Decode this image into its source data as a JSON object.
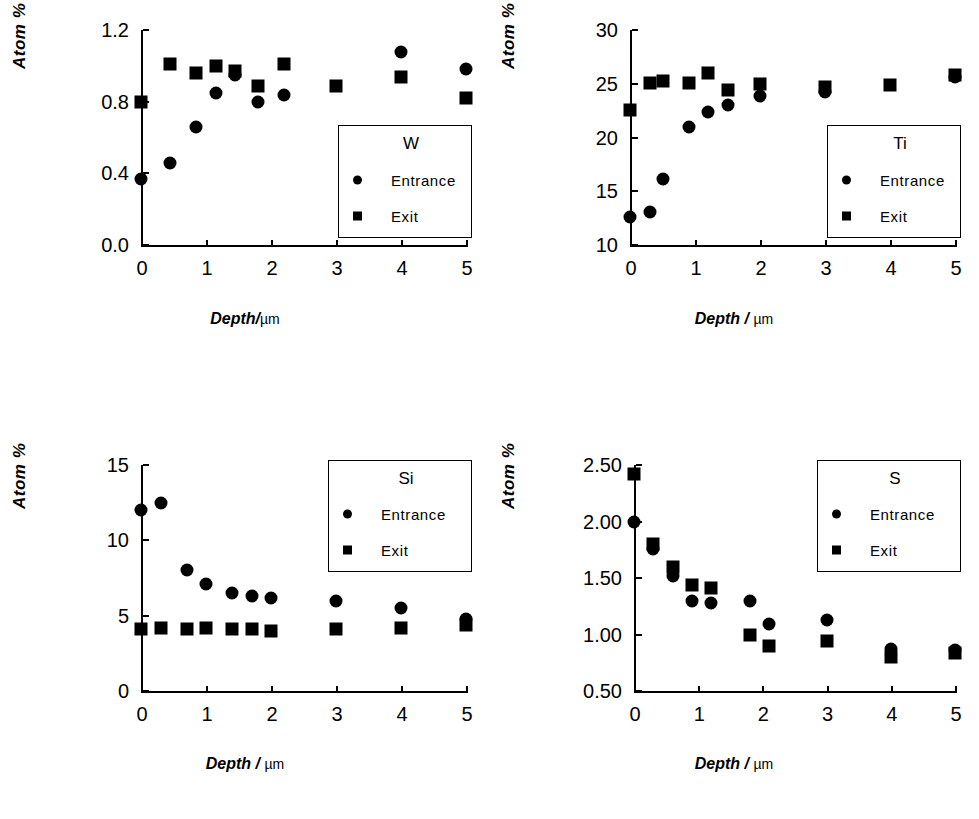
{
  "figure": {
    "marker_color": "#000000",
    "axis_color": "#000000",
    "background": "#ffffff"
  },
  "chart_data": [
    {
      "id": "w",
      "type": "scatter",
      "title": "W",
      "xlabel": "Depth/",
      "xunit": "µm",
      "ylabel": "Atom",
      "ylabel_unit": "%",
      "xlim": [
        0,
        5
      ],
      "ylim": [
        0.0,
        1.2
      ],
      "xticks": [
        0,
        1,
        2,
        3,
        4,
        5
      ],
      "xticklabels": [
        "0",
        "1",
        "2",
        "3",
        "4",
        "5"
      ],
      "yticks": [
        0.0,
        0.4,
        0.8,
        1.2
      ],
      "yticklabels": [
        "0.0",
        "0.4",
        "0.8",
        "1.2"
      ],
      "grid": false,
      "legend_position": "lower-right",
      "series": [
        {
          "name": "Entrance",
          "marker": "circle",
          "x": [
            0.0,
            0.45,
            0.85,
            1.15,
            1.45,
            1.8,
            2.2,
            4.0,
            5.0
          ],
          "y": [
            0.37,
            0.46,
            0.66,
            0.85,
            0.95,
            0.8,
            0.84,
            1.08,
            0.98
          ]
        },
        {
          "name": "Exit",
          "marker": "square",
          "x": [
            0.0,
            0.45,
            0.85,
            1.15,
            1.45,
            1.8,
            2.2,
            3.0,
            4.0,
            5.0
          ],
          "y": [
            0.8,
            1.01,
            0.96,
            1.0,
            0.97,
            0.89,
            1.01,
            0.89,
            0.94,
            0.82
          ]
        }
      ]
    },
    {
      "id": "ti",
      "type": "scatter",
      "title": "Ti",
      "xlabel": "Depth",
      "xunit": "µm",
      "xsep": " / ",
      "ylabel": "Atom",
      "ylabel_unit": "%",
      "xlim": [
        0,
        5
      ],
      "ylim": [
        10,
        30
      ],
      "xticks": [
        0,
        1,
        2,
        3,
        4,
        5
      ],
      "xticklabels": [
        "0",
        "1",
        "2",
        "3",
        "4",
        "5"
      ],
      "yticks": [
        10,
        15,
        20,
        25,
        30
      ],
      "yticklabels": [
        "10",
        "15",
        "20",
        "25",
        "30"
      ],
      "grid": false,
      "legend_position": "lower-right",
      "series": [
        {
          "name": "Entrance",
          "marker": "circle",
          "x": [
            0.0,
            0.3,
            0.5,
            0.9,
            1.2,
            1.5,
            2.0,
            3.0,
            5.0
          ],
          "y": [
            12.6,
            13.1,
            16.1,
            21.0,
            22.4,
            23.0,
            23.9,
            24.2,
            25.6
          ]
        },
        {
          "name": "Exit",
          "marker": "square",
          "x": [
            0.0,
            0.3,
            0.5,
            0.9,
            1.2,
            1.5,
            2.0,
            3.0,
            4.0,
            5.0
          ],
          "y": [
            22.6,
            25.1,
            25.3,
            25.1,
            26.0,
            24.4,
            25.0,
            24.7,
            24.9,
            25.8
          ]
        }
      ]
    },
    {
      "id": "si",
      "type": "scatter",
      "title": "Si",
      "xlabel": "Depth",
      "xunit": "µm",
      "xsep": " / ",
      "ylabel": "Atom",
      "ylabel_unit": "%",
      "xlim": [
        0,
        5
      ],
      "ylim": [
        0,
        15
      ],
      "xticks": [
        0,
        1,
        2,
        3,
        4,
        5
      ],
      "xticklabels": [
        "0",
        "1",
        "2",
        "3",
        "4",
        "5"
      ],
      "yticks": [
        0,
        5,
        10,
        15
      ],
      "yticklabels": [
        "0",
        "5",
        "10",
        "15"
      ],
      "grid": false,
      "legend_position": "upper-right",
      "series": [
        {
          "name": "Entrance",
          "marker": "circle",
          "x": [
            0.0,
            0.3,
            0.7,
            1.0,
            1.4,
            1.7,
            2.0,
            3.0,
            4.0,
            5.0
          ],
          "y": [
            12.0,
            12.5,
            8.0,
            7.1,
            6.5,
            6.3,
            6.2,
            6.0,
            5.5,
            4.8
          ]
        },
        {
          "name": "Exit",
          "marker": "square",
          "x": [
            0.0,
            0.3,
            0.7,
            1.0,
            1.4,
            1.7,
            2.0,
            3.0,
            4.0,
            5.0
          ],
          "y": [
            4.1,
            4.2,
            4.1,
            4.2,
            4.1,
            4.1,
            4.0,
            4.1,
            4.2,
            4.4
          ]
        }
      ]
    },
    {
      "id": "s",
      "type": "scatter",
      "title": "S",
      "xlabel": "Depth",
      "xunit": "µm",
      "xsep": " / ",
      "ylabel": "Atom",
      "ylabel_unit": "%",
      "xlim": [
        0,
        5
      ],
      "ylim": [
        0.5,
        2.5
      ],
      "xticks": [
        0,
        1,
        2,
        3,
        4,
        5
      ],
      "xticklabels": [
        "0",
        "1",
        "2",
        "3",
        "4",
        "5"
      ],
      "yticks": [
        0.5,
        1.0,
        1.5,
        2.0,
        2.5
      ],
      "yticklabels": [
        "0.50",
        "1.00",
        "1.50",
        "2.00",
        "2.50"
      ],
      "grid": false,
      "legend_position": "upper-right",
      "series": [
        {
          "name": "Entrance",
          "marker": "circle",
          "x": [
            0.0,
            0.3,
            0.6,
            0.9,
            1.2,
            1.8,
            2.1,
            3.0,
            4.0,
            5.0
          ],
          "y": [
            2.0,
            1.76,
            1.52,
            1.3,
            1.28,
            1.3,
            1.09,
            1.13,
            0.87,
            0.86
          ]
        },
        {
          "name": "Exit",
          "marker": "square",
          "x": [
            0.0,
            0.3,
            0.6,
            0.9,
            1.2,
            1.8,
            2.1,
            3.0,
            4.0,
            5.0
          ],
          "y": [
            2.42,
            1.8,
            1.6,
            1.44,
            1.41,
            1.0,
            0.9,
            0.94,
            0.8,
            0.84
          ]
        }
      ]
    }
  ],
  "legend_labels": {
    "entrance": "Entrance",
    "exit": "Exit"
  }
}
